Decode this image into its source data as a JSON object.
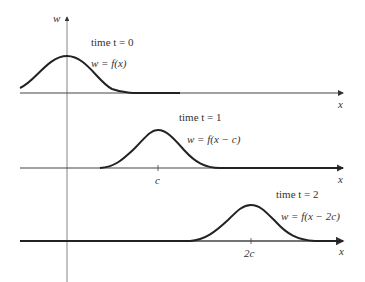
{
  "diagram": {
    "y_axis_label": "w",
    "panels": [
      {
        "time_label": "time t = 0",
        "equation": "w = f(x)",
        "x_axis_label": "x",
        "tick_label": ""
      },
      {
        "time_label": "time t = 1",
        "equation": "w = f(x − c)",
        "x_axis_label": "x",
        "tick_label": "c"
      },
      {
        "time_label": "time t = 2",
        "equation": "w = f(x − 2c)",
        "x_axis_label": "x",
        "tick_label": "2c"
      }
    ],
    "colors": {
      "curve": "#222222",
      "axis": "#555555",
      "text": "#333333"
    }
  }
}
